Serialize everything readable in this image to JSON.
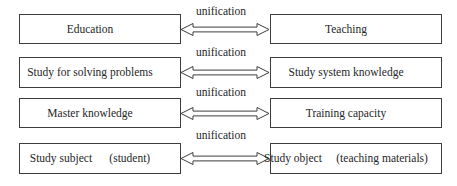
{
  "diagram": {
    "rows": [
      {
        "connector": "unification",
        "left": "Education",
        "right": "Teaching"
      },
      {
        "connector": "unification",
        "left": "Study for solving problems",
        "right": "Study system knowledge"
      },
      {
        "connector": "unification",
        "left": "Master knowledge",
        "right": "Training capacity"
      },
      {
        "connector": "unification",
        "left": "Study subject      (student)",
        "right": "Study object     (teaching materials)"
      }
    ]
  }
}
